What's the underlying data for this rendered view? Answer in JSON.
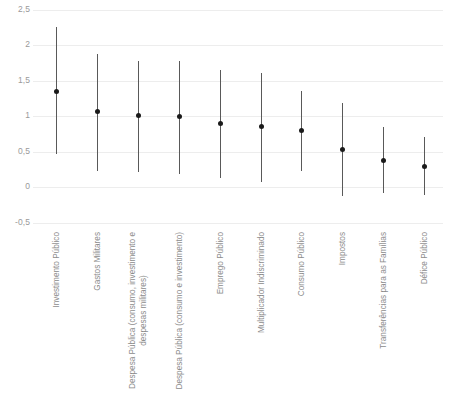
{
  "chart_data": {
    "type": "scatter",
    "title": "",
    "xlabel": "",
    "ylabel": "",
    "ylim": [
      -0.5,
      2.5
    ],
    "yticks": [
      "2,5",
      "2",
      "1,5",
      "1",
      "0,5",
      "0",
      "-0,5"
    ],
    "ytick_values": [
      2.5,
      2,
      1.5,
      1,
      0.5,
      0,
      -0.5
    ],
    "grid": true,
    "legend": "none",
    "decimal_separator": ",",
    "marker_color": "#1a1a1a",
    "whisker_color": "#595959",
    "gridline_color": "#ededed",
    "label_color": "#8c8c8c",
    "categories": [
      "Investimento Público",
      "Gastos Militares",
      "Despesa Pública (consumo, investimento e despesas militares)",
      "Despesa Pública (consumo e investimento)",
      "Emprego Público",
      "Multiplicador Indiscriminado",
      "Consumo Público",
      "Impostos",
      "Transferências para as Famílias",
      "Défice Público"
    ],
    "category_lines": [
      [
        "Investimento Público"
      ],
      [
        "Gastos Militares"
      ],
      [
        "Despesa Pública (consumo, investimento e",
        "despesas militares)"
      ],
      [
        "Despesa Pública (consumo e investimento)"
      ],
      [
        "Emprego Público"
      ],
      [
        "Multiplicador Indiscriminado"
      ],
      [
        "Consumo Público"
      ],
      [
        "Impostos"
      ],
      [
        "Transferências para as Famílias"
      ],
      [
        "Défice Público"
      ]
    ],
    "values": [
      1.35,
      1.06,
      1.01,
      1.0,
      0.9,
      0.85,
      0.8,
      0.53,
      0.37,
      0.29
    ],
    "lower": [
      0.47,
      0.23,
      0.21,
      0.18,
      0.12,
      0.07,
      0.22,
      -0.13,
      -0.08,
      -0.11
    ],
    "upper": [
      2.25,
      1.87,
      1.78,
      1.78,
      1.65,
      1.6,
      1.35,
      1.18,
      0.84,
      0.71
    ],
    "series": [
      {
        "name": "Investimento Público",
        "value": 1.35,
        "low": 0.47,
        "high": 2.25
      },
      {
        "name": "Gastos Militares",
        "value": 1.06,
        "low": 0.23,
        "high": 1.87
      },
      {
        "name": "Despesa Pública (consumo, investimento e despesas militares)",
        "value": 1.01,
        "low": 0.21,
        "high": 1.78
      },
      {
        "name": "Despesa Pública (consumo e investimento)",
        "value": 1.0,
        "low": 0.18,
        "high": 1.78
      },
      {
        "name": "Emprego Público",
        "value": 0.9,
        "low": 0.12,
        "high": 1.65
      },
      {
        "name": "Multiplicador Indiscriminado",
        "value": 0.85,
        "low": 0.07,
        "high": 1.6
      },
      {
        "name": "Consumo Público",
        "value": 0.8,
        "low": 0.22,
        "high": 1.35
      },
      {
        "name": "Impostos",
        "value": 0.53,
        "low": -0.13,
        "high": 1.18
      },
      {
        "name": "Transferências para as Famílias",
        "value": 0.37,
        "low": -0.08,
        "high": 0.84
      },
      {
        "name": "Défice Público",
        "value": 0.29,
        "low": -0.11,
        "high": 0.71
      }
    ]
  }
}
